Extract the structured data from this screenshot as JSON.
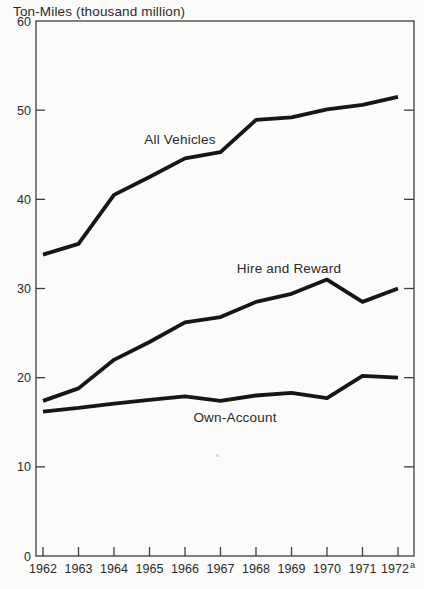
{
  "chart_data": {
    "type": "line",
    "title": "Ton-Miles (thousand million)",
    "xlabel": "",
    "ylabel": "Ton-Miles (thousand million)",
    "ylim": [
      0,
      60
    ],
    "grid": false,
    "legend_position": "inline-labels",
    "line_color": "#161616",
    "frame_color": "#3d3d3d",
    "text_color": "#2a2a2a",
    "background_color": "#fbfbf9",
    "y_ticks": [
      0,
      10,
      20,
      30,
      40,
      50,
      60
    ],
    "x_categories": [
      "1962",
      "1963",
      "1964",
      "1965",
      "1966",
      "1967",
      "1968",
      "1969",
      "1970",
      "1971",
      "1972"
    ],
    "x_superscripts": {
      "10": "a"
    },
    "series": [
      {
        "name": "All Vehicles",
        "values": [
          33.8,
          35.0,
          40.5,
          42.5,
          44.6,
          45.3,
          48.9,
          49.2,
          50.1,
          50.6,
          51.5
        ],
        "label_px": {
          "x": 180,
          "y": 144
        }
      },
      {
        "name": "Hire and Reward",
        "values": [
          17.4,
          18.8,
          22.0,
          24.0,
          26.2,
          26.8,
          28.5,
          29.4,
          31.0,
          28.5,
          30.0
        ],
        "label_px": {
          "x": 289,
          "y": 273
        }
      },
      {
        "name": "Own-Account",
        "values": [
          16.2,
          16.6,
          17.1,
          17.5,
          17.9,
          17.4,
          18.0,
          18.3,
          17.7,
          20.2,
          20.0
        ],
        "label_px": {
          "x": 235,
          "y": 422
        }
      }
    ]
  }
}
